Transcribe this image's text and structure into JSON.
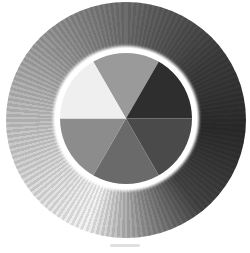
{
  "artwork": {
    "subject": "pencil value wheel",
    "outer_ring": {
      "description": "hatched ring shading from light (left) to dark (right)",
      "tones": [
        "#f4f4f4",
        "#b9b9b9",
        "#5e5e5e",
        "#2b2b2b"
      ]
    },
    "inner_wheel": {
      "wedges": [
        {
          "position": "top",
          "tone": "#9a9a9a"
        },
        {
          "position": "upper-right",
          "tone": "#2e2e2e"
        },
        {
          "position": "lower-right",
          "tone": "#4a4a4a"
        },
        {
          "position": "bottom",
          "tone": "#6a6a6a"
        },
        {
          "position": "lower-left",
          "tone": "#8c8c8c"
        },
        {
          "position": "upper-left",
          "tone": "#efefef"
        }
      ]
    }
  }
}
